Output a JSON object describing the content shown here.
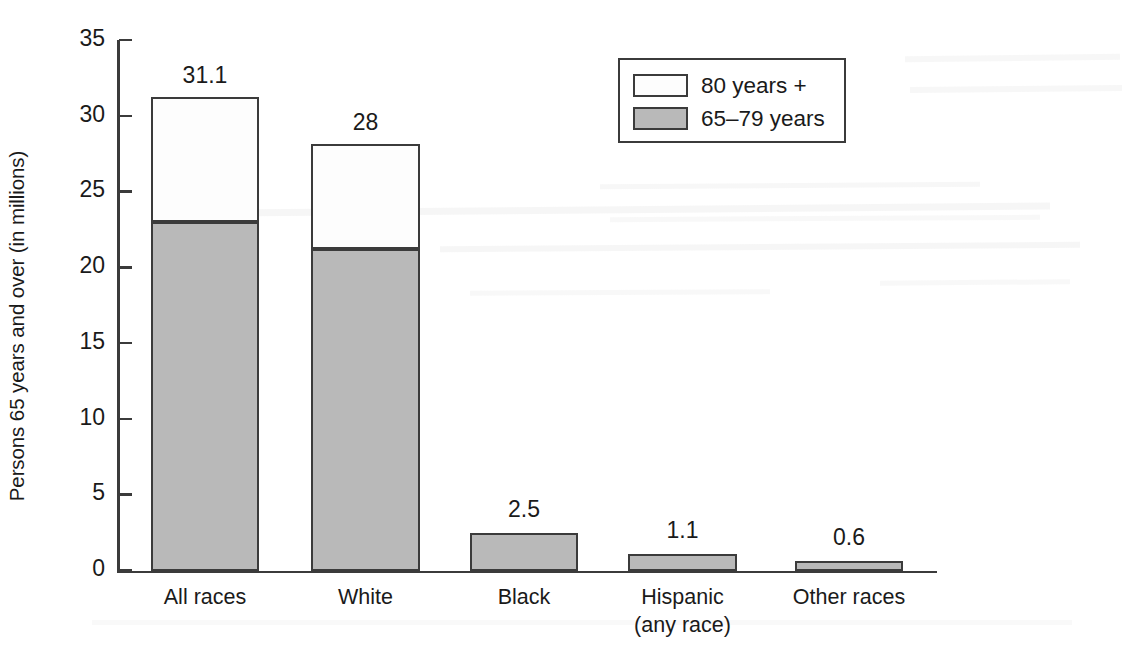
{
  "chart_data": {
    "type": "bar",
    "subtype": "stacked-vertical",
    "title": "",
    "xlabel": "",
    "ylabel": "Persons 65 years and over (in millions)",
    "ylim": [
      0,
      35
    ],
    "yticks": [
      0,
      5,
      10,
      15,
      20,
      25,
      30,
      35
    ],
    "ytick_labels": [
      "0",
      "5",
      "10",
      "15",
      "20",
      "25",
      "30",
      "35"
    ],
    "grid": false,
    "legend_position": "top-right",
    "categories": [
      "All races",
      "White",
      "Black",
      "Hispanic\n(any race)",
      "Other races"
    ],
    "category_lines": [
      [
        "All races"
      ],
      [
        "White"
      ],
      [
        "Black"
      ],
      [
        "Hispanic",
        "(any race)"
      ],
      [
        "Other races"
      ]
    ],
    "series": [
      {
        "name": "65–79 years",
        "color": "#b9b9b9",
        "values": [
          23.0,
          21.2,
          2.5,
          1.1,
          0.6
        ]
      },
      {
        "name": "80 years +",
        "color": "#fdfdfd",
        "values": [
          8.1,
          6.8,
          0.0,
          0.0,
          0.0
        ]
      }
    ],
    "totals": [
      31.1,
      28,
      2.5,
      1.1,
      0.6
    ],
    "total_labels": [
      "31.1",
      "28",
      "2.5",
      "1.1",
      "0.6"
    ]
  },
  "legend": {
    "items": [
      {
        "label": "80 years +",
        "swatch": "white"
      },
      {
        "label": "65–79 years",
        "swatch": "gray"
      }
    ]
  },
  "colors": {
    "gray_fill": "#b9b9b9",
    "white_fill": "#fdfdfd",
    "stroke": "#3b3b3b",
    "background": "#ffffff"
  }
}
